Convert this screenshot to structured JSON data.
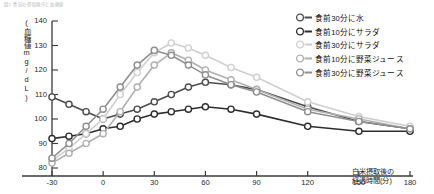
{
  "caption": "図2 食前の摂取順序と血糖値",
  "axis": {
    "y_title": "(血糖値mg/dL)",
    "x_title_line1": "白米摂取後の",
    "x_title_line2": "経過時間(分)",
    "y_ticks": [
      "140",
      "130",
      "120",
      "110",
      "100",
      "90",
      "80"
    ],
    "x_ticks": [
      "-30",
      "0",
      "30",
      "60",
      "90",
      "120",
      "150",
      "180"
    ]
  },
  "legend": {
    "items": [
      {
        "label": "食前30分に水",
        "color": "#4d4d4d",
        "marker": "open-circle"
      },
      {
        "label": "食前10分にサラダ",
        "color": "#2e2e2e",
        "marker": "open-circle"
      },
      {
        "label": "食前30分にサラダ",
        "color": "#cfcfcf",
        "marker": "open-circle"
      },
      {
        "label": "食前10分に野菜ジュース",
        "color": "#b0b0b0",
        "marker": "open-circle"
      },
      {
        "label": "食前30分に野菜ジュース",
        "color": "#8f8f8f",
        "marker": "open-circle"
      }
    ]
  },
  "chart_data": {
    "type": "line",
    "title": "図2 食前の摂取順序と血糖値",
    "xlabel": "白米摂取後の経過時間(分)",
    "ylabel": "(血糖値mg/dL)",
    "xlim": [
      -30,
      180
    ],
    "ylim": [
      80,
      140
    ],
    "grid": false,
    "legend_position": "right",
    "x": [
      -30,
      -20,
      -10,
      0,
      10,
      20,
      30,
      40,
      50,
      60,
      75,
      90,
      120,
      150,
      180
    ],
    "series": [
      {
        "name": "食前30分に水",
        "color": "#4d4d4d",
        "values": [
          109,
          106,
          103,
          100,
          102,
          104,
          107,
          110,
          113,
          115,
          114,
          112,
          105,
          99,
          96
        ]
      },
      {
        "name": "食前10分にサラダ",
        "color": "#2e2e2e",
        "values": [
          92,
          93,
          94,
          96,
          97,
          100,
          102,
          103,
          104,
          105,
          104,
          102,
          97,
          95,
          95
        ]
      },
      {
        "name": "食前30分にサラダ",
        "color": "#cfcfcf",
        "values": [
          83,
          88,
          94,
          100,
          110,
          119,
          127,
          131,
          129,
          126,
          121,
          117,
          107,
          101,
          97
        ]
      },
      {
        "name": "食前10分に野菜ジュース",
        "color": "#b0b0b0",
        "values": [
          82,
          86,
          90,
          94,
          103,
          113,
          122,
          127,
          124,
          120,
          116,
          112,
          104,
          100,
          96
        ]
      },
      {
        "name": "食前30分に野菜ジュース",
        "color": "#8f8f8f",
        "values": [
          84,
          90,
          97,
          104,
          113,
          122,
          128,
          126,
          122,
          118,
          114,
          111,
          103,
          99,
          96
        ]
      }
    ]
  }
}
